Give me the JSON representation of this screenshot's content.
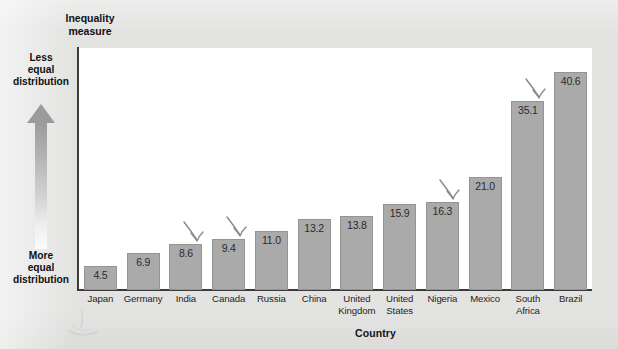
{
  "chart_data": {
    "type": "bar",
    "title": "",
    "xlabel": "Country",
    "ylabel": "Inequality measure",
    "categories": [
      "Japan",
      "Germany",
      "India",
      "Canada",
      "Russia",
      "China",
      "United Kingdom",
      "United States",
      "Nigeria",
      "Mexico",
      "South Africa",
      "Brazil"
    ],
    "values": [
      4.5,
      6.9,
      8.6,
      9.4,
      11.0,
      13.2,
      13.8,
      15.9,
      16.3,
      21.0,
      35.1,
      40.6
    ],
    "value_labels": [
      "4.5",
      "6.9",
      "8.6",
      "9.4",
      "11.0",
      "13.2",
      "13.8",
      "15.9",
      "16.3",
      "21.0",
      "35.1",
      "40.6"
    ],
    "category_lines": [
      [
        "Japan"
      ],
      [
        "Germany"
      ],
      [
        "India"
      ],
      [
        "Canada"
      ],
      [
        "Russia"
      ],
      [
        "China"
      ],
      [
        "United",
        "Kingdom"
      ],
      [
        "United",
        "States"
      ],
      [
        "Nigeria"
      ],
      [
        "Mexico"
      ],
      [
        "South",
        "Africa"
      ],
      [
        "Brazil"
      ]
    ],
    "ylim": [
      0,
      45
    ],
    "grid": false,
    "legend": null,
    "bar_color": "#aaaaaa",
    "bar_border_color": "#949494",
    "annotations": [
      {
        "target": "India",
        "type": "hand-drawn-arrow"
      },
      {
        "target": "Canada",
        "type": "hand-drawn-arrow"
      },
      {
        "target": "Nigeria",
        "type": "hand-drawn-arrow"
      },
      {
        "target": "South Africa",
        "type": "hand-drawn-arrow"
      }
    ],
    "annotated_categories": [
      "India",
      "Canada",
      "Nigeria",
      "South Africa"
    ]
  },
  "axis": {
    "y_title_lines": [
      "Inequality",
      "measure"
    ],
    "y_top_lines": [
      "Less",
      "equal",
      "distribution"
    ],
    "y_bottom_lines": [
      "More",
      "equal",
      "distribution"
    ],
    "x_title": "Country"
  },
  "colors": {
    "page_background": "#e3e3e2",
    "plot_background": "#ffffff",
    "axis_line": "#3b3b3b",
    "bar_fill": "#aaaaaa",
    "text": "#1a1a1a",
    "pen_annotation": "#8b8b8b"
  }
}
